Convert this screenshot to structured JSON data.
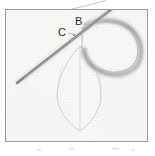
{
  "figure": {
    "kind": "embroidery-step-photograph",
    "frame": {
      "border_color": "#9a9a9a",
      "border_width_px": 1,
      "left": 5,
      "top": 9,
      "width": 143,
      "height": 133
    },
    "background": {
      "page_color": "#ffffff",
      "fabric_color": "#f7f7f5",
      "fabric_weave_color": "#ededea",
      "fabric_weave_spacing_px": 3
    },
    "labels": [
      {
        "name": "point-label-b",
        "text": "B",
        "x": 78,
        "y": 25
      },
      {
        "name": "point-label-c",
        "text": "C",
        "x": 61,
        "y": 36
      }
    ],
    "needle": {
      "color": "#8c8c8c",
      "highlight_color": "#b6b6b6",
      "width_px": 2.4,
      "tip_x": 17,
      "tip_y": 83,
      "eye_x": 112,
      "eye_y": 8
    },
    "thread": {
      "color": "#a9a9a9",
      "soft_color": "#c2c2c2",
      "width_px": 3.2,
      "loop_description": "thread emerges at B and loops clockwise to the right then down and back toward the leaf"
    },
    "leaf_outline": {
      "color": "#cfcfc9",
      "width_px": 0.9,
      "top_tip_x": 80,
      "top_tip_y": 46,
      "bottom_tip_x": 80,
      "bottom_tip_y": 131,
      "left_bulge_x": 57,
      "right_bulge_x": 101,
      "has_center_vein": true
    },
    "stray_thread_above_frame": {
      "color": "#c8c8c8",
      "from_x": 70,
      "from_y": 9,
      "to_x": 106,
      "to_y": 0
    },
    "bottom_marks": {
      "color": "#dcdcdc",
      "description": "four faint smudge marks below the frame"
    }
  }
}
